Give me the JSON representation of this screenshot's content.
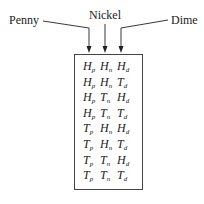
{
  "labels": {
    "penny": "Penny",
    "nickel": "Nickel",
    "dime": "Dime"
  },
  "outcomes": [
    [
      [
        "H",
        "p"
      ],
      [
        "H",
        "n"
      ],
      [
        "H",
        "d"
      ]
    ],
    [
      [
        "H",
        "p"
      ],
      [
        "H",
        "n"
      ],
      [
        "T",
        "d"
      ]
    ],
    [
      [
        "H",
        "p"
      ],
      [
        "T",
        "n"
      ],
      [
        "H",
        "d"
      ]
    ],
    [
      [
        "H",
        "p"
      ],
      [
        "T",
        "n"
      ],
      [
        "T",
        "d"
      ]
    ],
    [
      [
        "T",
        "p"
      ],
      [
        "H",
        "n"
      ],
      [
        "H",
        "d"
      ]
    ],
    [
      [
        "T",
        "p"
      ],
      [
        "H",
        "n"
      ],
      [
        "T",
        "d"
      ]
    ],
    [
      [
        "T",
        "p"
      ],
      [
        "T",
        "n"
      ],
      [
        "H",
        "d"
      ]
    ],
    [
      [
        "T",
        "p"
      ],
      [
        "T",
        "n"
      ],
      [
        "T",
        "d"
      ]
    ]
  ]
}
